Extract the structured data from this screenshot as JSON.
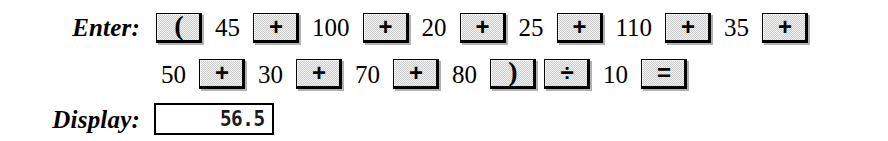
{
  "figure": {
    "enter_label": "Enter:",
    "display_label": "Display:"
  },
  "keystrokes": {
    "row1": [
      {
        "kind": "key",
        "name": "open-paren-key",
        "label": "("
      },
      {
        "kind": "operand",
        "name": "operand",
        "label": "45"
      },
      {
        "kind": "key",
        "name": "plus-key",
        "label": "+"
      },
      {
        "kind": "operand",
        "name": "operand",
        "label": "100"
      },
      {
        "kind": "key",
        "name": "plus-key",
        "label": "+"
      },
      {
        "kind": "operand",
        "name": "operand",
        "label": "20"
      },
      {
        "kind": "key",
        "name": "plus-key",
        "label": "+"
      },
      {
        "kind": "operand",
        "name": "operand",
        "label": "25"
      },
      {
        "kind": "key",
        "name": "plus-key",
        "label": "+"
      },
      {
        "kind": "operand",
        "name": "operand",
        "label": "110"
      },
      {
        "kind": "key",
        "name": "plus-key",
        "label": "+"
      },
      {
        "kind": "operand",
        "name": "operand",
        "label": "35"
      },
      {
        "kind": "key",
        "name": "plus-key",
        "label": "+"
      }
    ],
    "row2": [
      {
        "kind": "operand",
        "name": "operand",
        "label": "50"
      },
      {
        "kind": "key",
        "name": "plus-key",
        "label": "+"
      },
      {
        "kind": "operand",
        "name": "operand",
        "label": "30"
      },
      {
        "kind": "key",
        "name": "plus-key",
        "label": "+"
      },
      {
        "kind": "operand",
        "name": "operand",
        "label": "70"
      },
      {
        "kind": "key",
        "name": "plus-key",
        "label": "+"
      },
      {
        "kind": "operand",
        "name": "operand",
        "label": "80"
      },
      {
        "kind": "key",
        "name": "close-paren-key",
        "label": ")"
      },
      {
        "kind": "key",
        "name": "divide-key",
        "label": "÷"
      },
      {
        "kind": "operand",
        "name": "operand",
        "label": "10"
      },
      {
        "kind": "key",
        "name": "equals-key",
        "label": "="
      }
    ]
  },
  "display": {
    "value": "56.5"
  },
  "colors": {
    "page_background": "#ffffff",
    "ink": "#000000",
    "key_face": "#cdcdcd",
    "key_border": "#000000",
    "lcd_background": "#ffffff",
    "lcd_text": "#1a1a1a"
  }
}
